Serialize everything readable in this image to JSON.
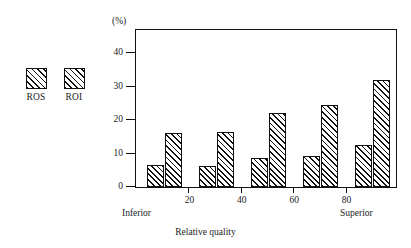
{
  "legend": {
    "entries": [
      {
        "label": "ROS",
        "swatch": "diagonal-hatch-swatch"
      },
      {
        "label": "ROI",
        "swatch": "diagonal-hatch-swatch"
      }
    ]
  },
  "axes": {
    "y_unit": "(%)",
    "y_ticks": [
      "0",
      "10",
      "20",
      "30",
      "40"
    ],
    "x_ticks": [
      "20",
      "40",
      "60",
      "80"
    ],
    "x_title": "Relative quality",
    "x_low_end_label": "Inferior",
    "x_high_end_label": "Superior"
  },
  "chart_data": {
    "type": "bar",
    "title": "",
    "xlabel": "Relative quality",
    "ylabel": "(%)",
    "ylim": [
      0,
      47
    ],
    "yticks": [
      0,
      10,
      20,
      30,
      40
    ],
    "xticks": [
      20,
      40,
      60,
      80
    ],
    "xtick_labels": [
      "20",
      "40",
      "60",
      "80"
    ],
    "x_axis_end_labels": {
      "left": "Inferior",
      "right": "Superior"
    },
    "grid": false,
    "legend_position": "outside-left",
    "categories": [
      "1",
      "2",
      "3",
      "4",
      "5"
    ],
    "series": [
      {
        "name": "ROS",
        "values": [
          6.5,
          6.3,
          8.7,
          9.3,
          12.5
        ]
      },
      {
        "name": "ROI",
        "values": [
          16.3,
          16.4,
          22.3,
          24.5,
          32.0
        ]
      }
    ],
    "bar_style": {
      "fill": "diagonal hatch",
      "edge_color": "#111111",
      "face_color": "#ffffff"
    }
  }
}
